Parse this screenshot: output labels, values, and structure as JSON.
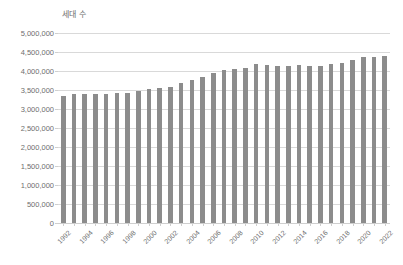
{
  "chart_data": {
    "type": "bar",
    "title": "세대 수",
    "xlabel": "",
    "ylabel": "",
    "ylim": [
      0,
      5000000
    ],
    "grid": true,
    "legend": false,
    "bar_color": "#8c8c8c",
    "gridline_color": "#d9d9d9",
    "text_color": "#6e6e6e",
    "background_color": "#ffffff",
    "y_ticks": [
      "0",
      "500,000",
      "1,000,000",
      "1,500,000",
      "2,000,000",
      "2,500,000",
      "3,000,000",
      "3,500,000",
      "4,000,000",
      "4,500,000",
      "5,000,000"
    ],
    "y_tick_values": [
      0,
      500000,
      1000000,
      1500000,
      2000000,
      2500000,
      3000000,
      3500000,
      4000000,
      4500000,
      5000000
    ],
    "categories": [
      "1992",
      "1993",
      "1994",
      "1995",
      "1996",
      "1997",
      "1998",
      "1999",
      "2000",
      "2001",
      "2002",
      "2003",
      "2004",
      "2005",
      "2006",
      "2007",
      "2008",
      "2009",
      "2010",
      "2011",
      "2012",
      "2013",
      "2014",
      "2015",
      "2016",
      "2017",
      "2018",
      "2019",
      "2020",
      "2021",
      "2022"
    ],
    "x_tick_labels": [
      "1992",
      "1994",
      "1996",
      "1998",
      "2000",
      "2002",
      "2004",
      "2006",
      "2008",
      "2010",
      "2012",
      "2014",
      "2016",
      "2018",
      "2020",
      "2022"
    ],
    "values": [
      3350000,
      3400000,
      3400000,
      3390000,
      3400000,
      3430000,
      3430000,
      3480000,
      3530000,
      3540000,
      3590000,
      3680000,
      3760000,
      3850000,
      3940000,
      4020000,
      4060000,
      4090000,
      4180000,
      4160000,
      4140000,
      4140000,
      4150000,
      4140000,
      4140000,
      4180000,
      4210000,
      4280000,
      4370000,
      4370000,
      4400000
    ]
  }
}
